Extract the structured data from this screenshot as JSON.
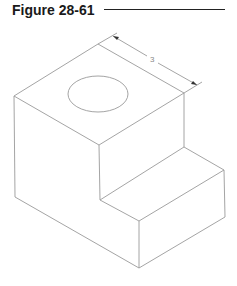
{
  "figure": {
    "title": "Figure 28-61",
    "dimension_label": "3",
    "line_color": "#9a9a9a",
    "title_color": "#1a1a1a"
  }
}
